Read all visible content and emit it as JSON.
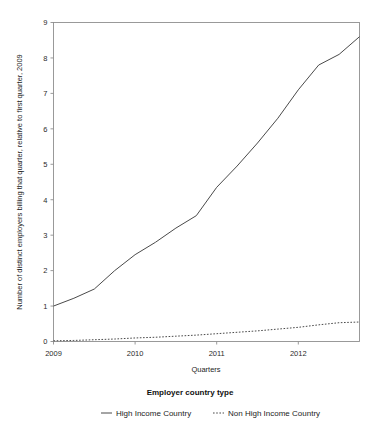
{
  "chart_data": {
    "type": "line",
    "title": "",
    "xlabel": "Quarters",
    "ylabel": "Number of distinct employers billing that quarter, relative to first quarter, 2009",
    "xlim": [
      2009.0,
      2012.75
    ],
    "ylim": [
      0,
      9
    ],
    "x_tick_labels": [
      "2009",
      "2010",
      "2011",
      "2012"
    ],
    "x_tick_values": [
      2009,
      2010,
      2011,
      2012
    ],
    "y_tick_labels": [
      "0",
      "1",
      "2",
      "3",
      "4",
      "5",
      "6",
      "7",
      "8",
      "9"
    ],
    "y_tick_values": [
      0,
      1,
      2,
      3,
      4,
      5,
      6,
      7,
      8,
      9
    ],
    "grid": false,
    "legend_position": "bottom",
    "legend_title": "Employer country type",
    "x": [
      2009.0,
      2009.25,
      2009.5,
      2009.75,
      2010.0,
      2010.25,
      2010.5,
      2010.75,
      2011.0,
      2011.25,
      2011.5,
      2011.75,
      2012.0,
      2012.25,
      2012.5,
      2012.75
    ],
    "series": [
      {
        "name": "High Income Country",
        "style": "solid",
        "color": "#4a4a4a",
        "values": [
          1.0,
          1.22,
          1.48,
          2.0,
          2.45,
          2.8,
          3.2,
          3.55,
          4.35,
          4.95,
          5.6,
          6.3,
          7.1,
          7.8,
          8.1,
          8.6
        ]
      },
      {
        "name": "Non High Income Country",
        "style": "dotted",
        "color": "#4a4a4a",
        "values": [
          0.02,
          0.03,
          0.05,
          0.07,
          0.1,
          0.12,
          0.15,
          0.18,
          0.22,
          0.26,
          0.3,
          0.35,
          0.4,
          0.47,
          0.53,
          0.55
        ]
      }
    ]
  },
  "legend": {
    "title": "Employer country type",
    "entries": [
      {
        "label": "High Income Country",
        "style": "solid"
      },
      {
        "label": "Non High Income Country",
        "style": "dotted"
      }
    ]
  },
  "axes": {
    "x_title": "Quarters",
    "y_title": "Number of distinct employers billing that quarter, relative to first quarter, 2009"
  }
}
